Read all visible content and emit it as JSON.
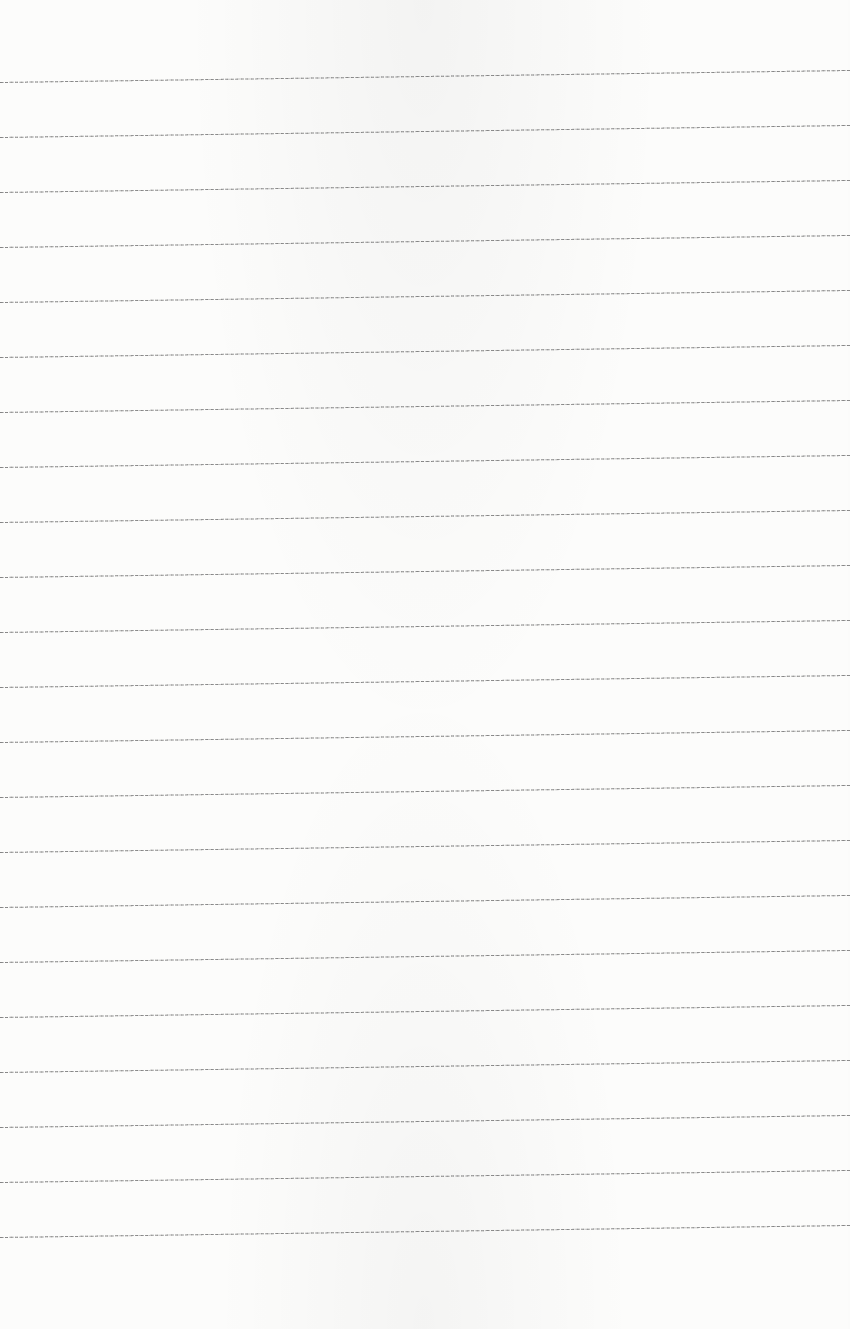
{
  "page": {
    "type": "lined-paper",
    "paper_color": "#fcfcfb",
    "line_color": "#8e8e8e",
    "line_count": 22,
    "first_line_y_left": 82,
    "line_spacing": 55,
    "line_tilt_px": -12
  }
}
